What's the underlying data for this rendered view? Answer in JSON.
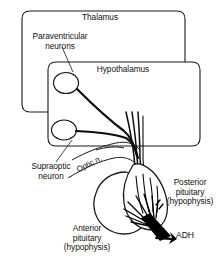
{
  "figure": {
    "background_color": "#ffffff",
    "line_color": "#1a1a1a"
  },
  "regions": [
    {
      "id": "thalamus",
      "label": "Thalamus",
      "shape": "rounded-rectangle"
    },
    {
      "id": "hypothalamus",
      "label": "Hypothalamus",
      "shape": "rounded-rectangle"
    }
  ],
  "labels": {
    "thalamus": "Thalamus",
    "hypothalamus": "Hypothalamus",
    "paraventricular_neurons": "Paraventricular\nneurons",
    "supraoptic_neuron": "Supraoptic\nneuron",
    "optic_nerve": "Optic n.",
    "posterior_pituitary": "Posterior\npituitary\n(hypophysis)",
    "anterior_pituitary": "Anterior\npituitary\n(hypophysis)",
    "adh": "ADH"
  },
  "structures": [
    {
      "id": "paraventricular-neuron-soma",
      "name": "Paraventricular neuron cell body"
    },
    {
      "id": "supraoptic-neuron-soma",
      "name": "Supraoptic neuron cell body"
    },
    {
      "id": "axon-bundle",
      "name": "Hypothalamo-hypophyseal tract"
    },
    {
      "id": "optic-nerve",
      "name": "Optic nerve"
    },
    {
      "id": "anterior-pituitary-lobe",
      "name": "Anterior pituitary lobe"
    },
    {
      "id": "posterior-pituitary-lobe",
      "name": "Posterior pituitary lobe"
    },
    {
      "id": "nerve-terminals",
      "name": "Axon terminals"
    },
    {
      "id": "adh-secretion-arrow",
      "name": "ADH release arrow"
    }
  ]
}
